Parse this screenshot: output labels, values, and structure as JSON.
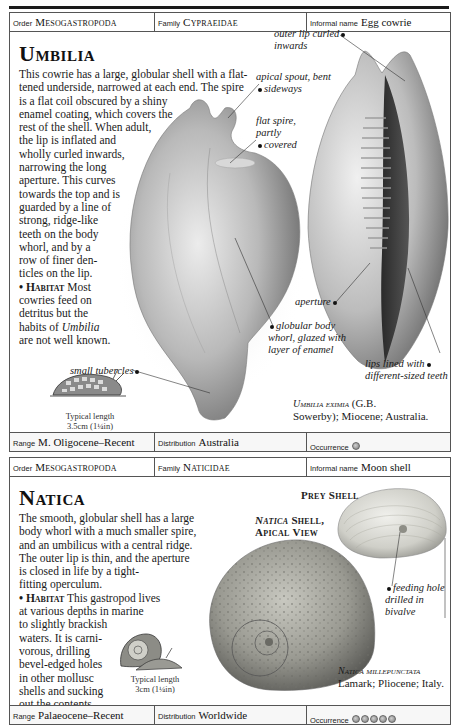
{
  "entries": [
    {
      "header": {
        "order_label": "Order",
        "order_value": "Mesogastropoda",
        "family_label": "Family",
        "family_value": "Cypraeidae",
        "informal_label": "Informal name",
        "informal_value": "Egg cowrie"
      },
      "title": "Umbilia",
      "description_lines": [
        "This cowrie has a large, globular shell with a flat-",
        "tened underside, narrowed at each end. The spire",
        "is a flat coil obscured by a shiny",
        "enamel coating, which covers the",
        "rest of the shell. When adult,",
        "the lip is inflated and",
        "wholly curled inwards,",
        "narrowing the long",
        "aperture. This curves",
        "towards the top and is",
        "guarded by a line of",
        "strong, ridge-like",
        "teeth on the body",
        "whorl, and by a",
        "row of finer den-",
        "ticles on the lip."
      ],
      "habitat_label": "• Habitat",
      "habitat_lines": [
        "Most",
        "cowries feed on",
        "detritus but the",
        "habits of",
        "Umbilia",
        "are not well known."
      ],
      "callouts": {
        "outer_lip": [
          "outer lip curled",
          "inwards"
        ],
        "apical_spout": [
          "apical spout, bent",
          "sideways"
        ],
        "flat_spire": [
          "flat spire,",
          "partly",
          "covered"
        ],
        "aperture": "aperture",
        "globular_body": [
          "globular body",
          "whorl, glazed with",
          "layer of enamel"
        ],
        "small_tubercles": "small tubercles",
        "lips_lined": [
          "lips lined with",
          "different-sized teeth"
        ]
      },
      "typical_length": [
        "Typical length",
        "3.5cm (1¼in)"
      ],
      "species_caption": {
        "name": "Umbilia eximia",
        "line1_rest": "(G.B.",
        "line2": "Sowerby); Miocene; Australia."
      },
      "footer": {
        "range_label": "Range",
        "range_value": "M. Oligocene–Recent",
        "distribution_label": "Distribution",
        "distribution_value": "Australia",
        "occurrence_label": "Occurrence",
        "occurrence_count": 1
      }
    },
    {
      "header": {
        "order_label": "Order",
        "order_value": "Mesogastropoda",
        "family_label": "Family",
        "family_value": "Naticidae",
        "informal_label": "Informal name",
        "informal_value": "Moon shell"
      },
      "title": "Natica",
      "description_lines": [
        "The smooth, globular shell has a large",
        "body whorl with a much smaller spire,",
        "and an umbilicus with a central ridge.",
        "The outer lip is thin, and the aperture",
        "is closed in life by a tight-",
        "fitting operculum."
      ],
      "habitat_label": "• Habitat",
      "habitat_lines": [
        "This gastropod lives",
        "at various depths in marine",
        "to slightly brackish",
        "waters. It is carni-",
        "vorous, drilling",
        "bevel-edged holes",
        "in other mollusc",
        "shells and sucking",
        "out the contents."
      ],
      "labels": {
        "prey_shell": "Prey Shell",
        "natica_shell_name": "Natica",
        "natica_shell_rest": "Shell,",
        "apical_view": "Apical View"
      },
      "callouts": {
        "feeding_hole": [
          "feeding hole",
          "drilled in",
          "bivalve"
        ]
      },
      "typical_length": [
        "Typical length",
        "3cm (1¼in)"
      ],
      "species_caption": {
        "name": "Natica millepunctata",
        "line2": "Lamark; Pliocene; Italy."
      },
      "footer": {
        "range_label": "Range",
        "range_value": "Palaeocene–Recent",
        "distribution_label": "Distribution",
        "distribution_value": "Worldwide",
        "occurrence_label": "Occurrence",
        "occurrence_count": 5
      }
    }
  ]
}
